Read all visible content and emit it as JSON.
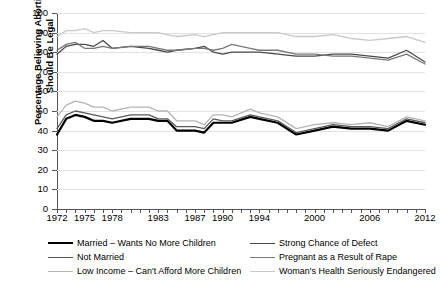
{
  "chart_data": {
    "type": "line",
    "title": "",
    "xlabel": "",
    "ylabel": "Percentage Believing Abortion Should Be Legal",
    "ylim": [
      0,
      100
    ],
    "yticks": [
      0,
      10,
      20,
      30,
      40,
      50,
      60,
      70,
      80,
      90,
      100
    ],
    "xlim": [
      1972,
      2012
    ],
    "grid": true,
    "legend_position": "bottom",
    "xtick_labels": [
      "1972",
      "1975",
      "1978",
      "1983",
      "1987",
      "1990",
      "1994",
      "2000",
      "2006",
      "2012"
    ],
    "xtick_values": [
      1972,
      1975,
      1978,
      1983,
      1987,
      1990,
      1994,
      2000,
      2006,
      2012
    ],
    "x": [
      1972,
      1973,
      1974,
      1975,
      1976,
      1977,
      1978,
      1980,
      1982,
      1983,
      1984,
      1985,
      1987,
      1988,
      1989,
      1990,
      1991,
      1993,
      1994,
      1996,
      1998,
      2000,
      2002,
      2004,
      2006,
      2008,
      2010,
      2012
    ],
    "series": [
      {
        "name": "Married – Wants No More Children",
        "color": "#000000",
        "width": 2.2,
        "values": [
          38,
          46,
          48,
          47,
          45,
          45,
          44,
          46,
          46,
          45,
          45,
          40,
          40,
          39,
          44,
          44,
          44,
          47,
          46,
          44,
          38,
          40,
          42,
          41,
          41,
          40,
          45,
          43
        ]
      },
      {
        "name": "Not Married",
        "color": "#5a5a5a",
        "width": 1.3,
        "values": [
          41,
          48,
          50,
          49,
          48,
          47,
          46,
          48,
          48,
          46,
          46,
          42,
          42,
          41,
          46,
          45,
          45,
          48,
          47,
          45,
          39,
          41,
          43,
          42,
          42,
          41,
          46,
          44
        ]
      },
      {
        "name": "Low Income – Can't Afford More Children",
        "color": "#b5b5b5",
        "width": 1.3,
        "values": [
          47,
          53,
          55,
          54,
          52,
          52,
          50,
          52,
          52,
          50,
          50,
          45,
          45,
          43,
          48,
          48,
          47,
          51,
          49,
          47,
          41,
          43,
          44,
          43,
          44,
          42,
          47,
          45
        ]
      },
      {
        "name": "Strong Chance of Defect",
        "color": "#4a4a4a",
        "width": 1.3,
        "values": [
          79,
          83,
          84,
          84,
          83,
          86,
          82,
          83,
          82,
          81,
          80,
          81,
          82,
          83,
          80,
          79,
          80,
          80,
          80,
          79,
          78,
          78,
          79,
          79,
          78,
          77,
          81,
          75
        ]
      },
      {
        "name": "Pregnant as a Result of Rape",
        "color": "#787878",
        "width": 1.3,
        "values": [
          81,
          84,
          85,
          82,
          82,
          83,
          82,
          83,
          83,
          82,
          81,
          81,
          82,
          82,
          81,
          82,
          84,
          82,
          81,
          81,
          79,
          79,
          78,
          78,
          77,
          76,
          79,
          74
        ]
      },
      {
        "name": "Woman's Health Seriously Endangered",
        "color": "#c9c9c9",
        "width": 1.3,
        "values": [
          88,
          91,
          91,
          92,
          90,
          91,
          91,
          90,
          90,
          90,
          89,
          88,
          89,
          88,
          89,
          90,
          90,
          90,
          90,
          90,
          88,
          88,
          89,
          87,
          86,
          87,
          88,
          85
        ]
      }
    ]
  },
  "axes": {
    "y_title_line1": "Percentage Believing Abortion",
    "y_title_line2": "Should Be Legal"
  }
}
